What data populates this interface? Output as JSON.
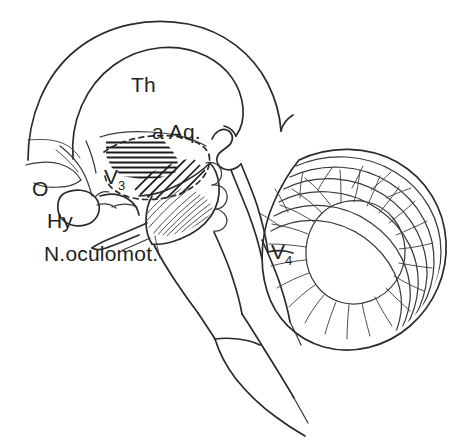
{
  "figure": {
    "kind": "anatomical-line-drawing",
    "background_color": "#ffffff",
    "line_color": "#2b2b2b",
    "hatch_color": "#1c1c1c",
    "width": 471,
    "height": 446
  },
  "labels": {
    "thalamus": "Th",
    "aqueduct": "a Aq.",
    "third_ventricle": "V",
    "third_ventricle_sub": "3",
    "fourth_ventricle": "V",
    "fourth_ventricle_sub": "4",
    "optic_chiasm": "O",
    "hypophysis": "Hy",
    "oculomotor_nerve": "N.oculomot."
  },
  "structures": {
    "cerebrum": "cerebral-hemisphere-outline",
    "corpus_callosum": "corpus-callosum-arc",
    "thalamus_body": "thalamus-region",
    "massa_intermedia": "horizontal-hatched-region",
    "hypothalamus": "diagonal-hatched-region",
    "third_ventricle_outline": "dashed-oval-outline",
    "cerebral_aqueduct": "aqueduct-channel",
    "midbrain": "midbrain-tegmentum",
    "pons": "pons-body",
    "medulla": "medulla-oblongata",
    "cerebellum": "cerebellum-arbor-vitae",
    "fourth_ventricle_space": "fourth-ventricle-wedge",
    "optic_chiasm_shape": "optic-chiasm-curve",
    "pituitary": "pituitary-gland-oval",
    "oculomotor": "oculomotor-nerve-root"
  }
}
